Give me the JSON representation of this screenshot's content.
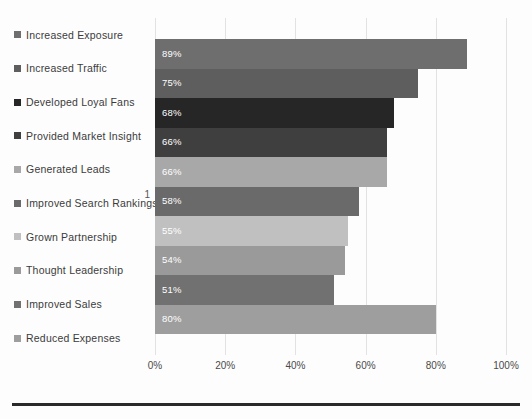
{
  "chart_data": {
    "type": "bar",
    "orientation": "horizontal",
    "title": "",
    "subtitle": "",
    "xlabel": "",
    "ylabel": "",
    "xlim": [
      0,
      100
    ],
    "xticks": [
      "0%",
      "20%",
      "40%",
      "60%",
      "80%",
      "100%"
    ],
    "xtick_values": [
      0,
      20,
      40,
      60,
      80,
      100
    ],
    "category_axis_label": "1",
    "grid": true,
    "legend_position": "left",
    "categories": [
      "Increased Exposure",
      "Increased Traffic",
      "Developed Loyal Fans",
      "Provided Market Insight",
      "Generated Leads",
      "Improved Search Rankings",
      "Grown Partnership",
      "Thought Leadership",
      "Improved Sales",
      "Reduced Expenses"
    ],
    "values": [
      89,
      75,
      68,
      66,
      66,
      58,
      55,
      54,
      51,
      80
    ],
    "data_labels": [
      "89%",
      "75%",
      "68%",
      "66%",
      "66%",
      "58%",
      "55%",
      "54%",
      "51%",
      "80%"
    ],
    "colors": [
      "#6e6e6e",
      "#5e5e5e",
      "#262626",
      "#3f3f3f",
      "#a8a8a8",
      "#6a6a6a",
      "#c0c0c0",
      "#9a9a9a",
      "#717171",
      "#9e9e9e"
    ],
    "series": [
      {
        "name": "1",
        "points": [
          {
            "category": "Increased Exposure",
            "value": 89,
            "label": "89%",
            "color": "#6e6e6e"
          },
          {
            "category": "Increased Traffic",
            "value": 75,
            "label": "75%",
            "color": "#5e5e5e"
          },
          {
            "category": "Developed Loyal Fans",
            "value": 68,
            "label": "68%",
            "color": "#262626"
          },
          {
            "category": "Provided Market Insight",
            "value": 66,
            "label": "66%",
            "color": "#3f3f3f"
          },
          {
            "category": "Generated Leads",
            "value": 66,
            "label": "66%",
            "color": "#a8a8a8"
          },
          {
            "category": "Improved Search Rankings",
            "value": 58,
            "label": "58%",
            "color": "#6a6a6a"
          },
          {
            "category": "Grown Partnership",
            "value": 55,
            "label": "55%",
            "color": "#c0c0c0"
          },
          {
            "category": "Thought Leadership",
            "value": 54,
            "label": "54%",
            "color": "#9a9a9a"
          },
          {
            "category": "Improved Sales",
            "value": 51,
            "label": "51%",
            "color": "#717171"
          },
          {
            "category": "Reduced Expenses",
            "value": 80,
            "label": "80%",
            "color": "#9e9e9e"
          }
        ]
      }
    ],
    "legend_entries": [
      {
        "label": "Increased Exposure",
        "color": "#6e6e6e"
      },
      {
        "label": "Increased Traffic",
        "color": "#5e5e5e"
      },
      {
        "label": "Developed Loyal Fans",
        "color": "#262626"
      },
      {
        "label": "Provided Market Insight",
        "color": "#3f3f3f"
      },
      {
        "label": "Generated Leads",
        "color": "#a8a8a8"
      },
      {
        "label": "Improved Search Rankings",
        "color": "#6a6a6a"
      },
      {
        "label": "Grown Partnership",
        "color": "#c0c0c0"
      },
      {
        "label": "Thought Leadership",
        "color": "#9a9a9a"
      },
      {
        "label": "Improved Sales",
        "color": "#717171"
      },
      {
        "label": "Reduced Expenses",
        "color": "#9e9e9e"
      }
    ]
  },
  "style": {
    "background": "#fdfdfd",
    "gridline_color": "#e2e2e2",
    "label_text_color": "#3b3b3b",
    "value_label_color": "#ffffff",
    "tick_text_color": "#4a4a4a",
    "bottom_rule_color": "#2a2a2a"
  }
}
